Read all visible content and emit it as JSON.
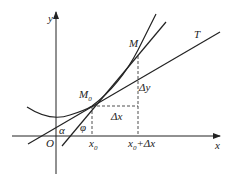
{
  "diagram": {
    "labels": {
      "y_axis": "y",
      "x_axis": "x",
      "origin": "O",
      "point_M0": "M",
      "point_M0_sub": "0",
      "point_M": "M",
      "tangent": "T",
      "delta_x": "Δx",
      "delta_y": "Δy",
      "x0": "x",
      "x0_sub": "0",
      "x0_plus": "+Δx",
      "alpha": "α",
      "phi": "φ"
    },
    "colors": {
      "line": "#222222",
      "background": "#ffffff"
    }
  }
}
